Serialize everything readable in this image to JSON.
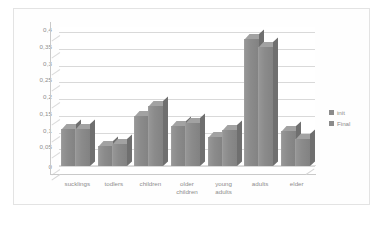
{
  "chart_data": {
    "type": "bar",
    "title": "",
    "subtitle": "",
    "xlabel": "",
    "ylabel": "",
    "grid": true,
    "legend_position": "right",
    "style": "3d-clustered-column",
    "decimal_separator": ",",
    "categories": [
      "sucklings",
      "todlers",
      "children",
      "older children",
      "young adults",
      "adults",
      "elder"
    ],
    "series": [
      {
        "name": "init",
        "values": [
          0.11,
          0.06,
          0.148,
          0.118,
          0.088,
          0.38,
          0.105
        ]
      },
      {
        "name": "Final",
        "values": [
          0.11,
          0.065,
          0.178,
          0.128,
          0.108,
          0.355,
          0.08
        ]
      }
    ],
    "ylim": [
      0,
      0.4
    ],
    "ytick_values": [
      0,
      0.05,
      0.1,
      0.15,
      0.2,
      0.25,
      0.3,
      0.35,
      0.4
    ],
    "ytick_labels": [
      "0",
      "0,05",
      "0,1",
      "0,15",
      "0,2",
      "0,25",
      "0,3",
      "0,35",
      "0,4"
    ],
    "colors": {
      "bar_face": "#8b8b8b",
      "bar_top": "#a2a2a2",
      "bar_side": "#6f6f6f",
      "gridline": "#d9d9d9",
      "axis": "#c9c9c9",
      "text": "#8d8d8d",
      "border": "#e3e3e3",
      "background": "#ffffff"
    }
  },
  "legend": {
    "items": [
      {
        "label": "init"
      },
      {
        "label": "Final"
      }
    ]
  }
}
